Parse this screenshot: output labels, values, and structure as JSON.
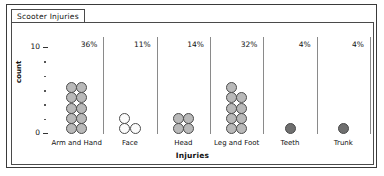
{
  "window": {
    "tab_label": "Scooter Injuries"
  },
  "chart_data": {
    "type": "bar",
    "title": "",
    "xlabel": "Injuries",
    "ylabel": "count",
    "ylim": [
      0,
      11
    ],
    "y_tick_labels": [
      "10",
      "0"
    ],
    "y_ticks": [
      10,
      0
    ],
    "minor_ticks": 5,
    "grid": false,
    "legend": "none",
    "categories": [
      "Arm and Hand",
      "Face",
      "Head",
      "Leg and Foot",
      "Teeth",
      "Trunk"
    ],
    "values": [
      10,
      3,
      4,
      9,
      1,
      1
    ],
    "percent_labels": [
      "36%",
      "11%",
      "14%",
      "32%",
      "4%",
      "4%"
    ],
    "dot_fills": [
      "gray",
      "white",
      "gray",
      "gray",
      "dark",
      "dark"
    ],
    "colors": {
      "dot_gray": "#b9b9b9",
      "dot_white": "#fbfbfb",
      "dot_dark": "#6f6f6f",
      "dot_outline": "#4d4d4d",
      "separator": "#8a8a8a",
      "text": "#111111",
      "frame": "#3a3a3a"
    }
  }
}
